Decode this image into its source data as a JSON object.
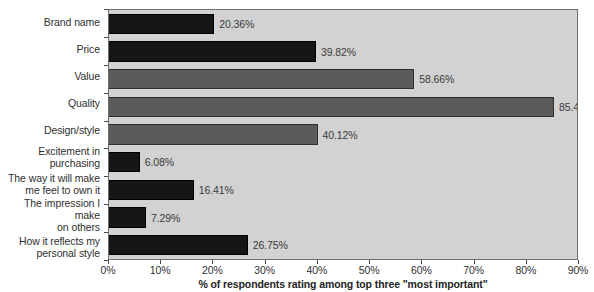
{
  "chart_data": {
    "type": "bar",
    "orientation": "horizontal",
    "title": "",
    "xlabel": "% of respondents rating among top three \"most important\"",
    "ylabel": "",
    "xlim": [
      0,
      90
    ],
    "xtick_labels": [
      "0%",
      "10%",
      "20%",
      "30%",
      "40%",
      "50%",
      "60%",
      "70%",
      "80%",
      "90%"
    ],
    "xtick_values": [
      0,
      10,
      20,
      30,
      40,
      50,
      60,
      70,
      80,
      90
    ],
    "grid": false,
    "legend": "none",
    "categories": [
      "Brand name",
      "Price",
      "Value",
      "Quality",
      "Design/style",
      "Excitement in\npurchasing",
      "The way it will make\nme feel to own it",
      "The impression I make\non others",
      "How it reflects my\npersonal style"
    ],
    "values": [
      20.36,
      39.82,
      58.66,
      85.41,
      40.12,
      6.08,
      16.41,
      7.29,
      26.75
    ],
    "value_labels": [
      "20.36%",
      "39.82%",
      "58.66%",
      "85.41%",
      "40.12%",
      "6.08%",
      "16.41%",
      "7.29%",
      "26.75%"
    ],
    "bar_shades": [
      "dark",
      "dark",
      "gray",
      "gray",
      "gray",
      "dark",
      "dark",
      "dark",
      "dark"
    ],
    "colors": {
      "bar_dark": "#151515",
      "bar_gray": "#5b5b5b",
      "plot_background": "#d2d2d2",
      "page_background": "#ffffff",
      "axis_line": "#6f6f6f",
      "text": "#2f2f2f"
    }
  }
}
